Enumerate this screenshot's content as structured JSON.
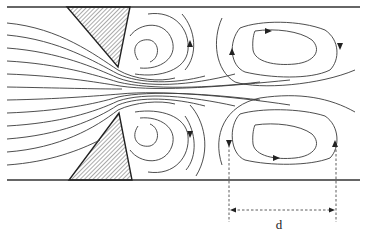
{
  "figure": {
    "labels": {
      "spacing": "d"
    },
    "elements": {
      "channel_walls": 2,
      "baffles": 2,
      "near_wake_spirals": 2,
      "downstream_closed_vortices": 2
    },
    "colors": {
      "line": "#333333",
      "hatch": "#555555",
      "background": "#ffffff"
    }
  }
}
